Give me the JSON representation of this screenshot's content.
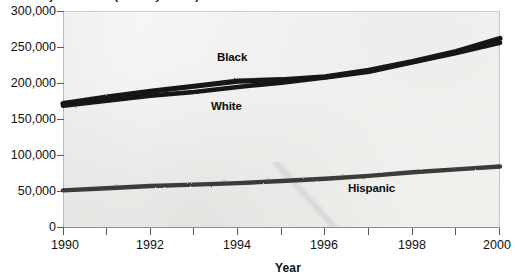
{
  "figure": {
    "title_truncated": "of jail inmates (one-day count)",
    "background_color": "#f5f5f3",
    "ink_color": "#111111"
  },
  "axis": {
    "x_title": "Year",
    "y_title": "",
    "y_ticks": [
      "0",
      "50,000",
      "100,000",
      "150,000",
      "200,000",
      "250,000",
      "300,000"
    ],
    "x_ticks": [
      "1990",
      "1991",
      "1992",
      "1993",
      "1994",
      "1995",
      "1996",
      "1997",
      "1998",
      "1999",
      "2000"
    ],
    "x_tick_labels_shown": [
      "1990",
      "1992",
      "1994",
      "1996",
      "1998",
      "2000"
    ]
  },
  "annotations": {
    "black_label": "Black",
    "white_label": "White",
    "hispanic_label": "Hispanic"
  },
  "chart_data": {
    "type": "line",
    "title": "of jail inmates (one-day count)",
    "xlabel": "Year",
    "ylabel": "",
    "xlim": [
      1990,
      2000
    ],
    "ylim": [
      0,
      300000
    ],
    "grid": false,
    "legend_position": "inline-annotations",
    "x": [
      1990,
      1991,
      1992,
      1993,
      1994,
      1995,
      1996,
      1997,
      1998,
      1999,
      2000
    ],
    "series": [
      {
        "name": "Black",
        "color": "#141414",
        "values": [
          172000,
          181000,
          189000,
          196000,
          203000,
          205000,
          209000,
          218000,
          230000,
          244000,
          262000
        ]
      },
      {
        "name": "White",
        "color": "#141414",
        "values": [
          169000,
          176000,
          183000,
          188000,
          195000,
          201000,
          208000,
          216000,
          229000,
          242000,
          256000
        ]
      },
      {
        "name": "Hispanic",
        "color": "#3b3b3b",
        "values": [
          52000,
          55000,
          58000,
          60000,
          62000,
          65000,
          68000,
          72000,
          77000,
          81000,
          85000
        ]
      }
    ]
  }
}
